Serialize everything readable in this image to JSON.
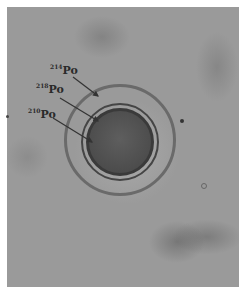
{
  "figure": {
    "labels": [
      {
        "mass": "214",
        "element": "Po"
      },
      {
        "mass": "218",
        "element": "Po"
      },
      {
        "mass": "210",
        "element": "Po"
      }
    ]
  }
}
